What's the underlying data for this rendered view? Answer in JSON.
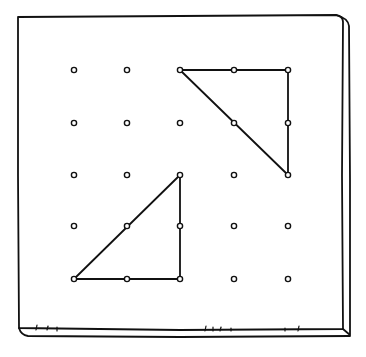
{
  "diagram": {
    "type": "geoboard",
    "grid": {
      "rows": 5,
      "cols": 5
    },
    "colors": {
      "ink": "#111111",
      "background": "#ffffff"
    },
    "board": {
      "face": {
        "x1": 18,
        "y1": 16,
        "x2": 343,
        "y2": 330
      },
      "depth_right": 7,
      "depth_bottom": 7
    },
    "pegs": {
      "xs": [
        74,
        127,
        180,
        234,
        288
      ],
      "ys": [
        70,
        123,
        175,
        226,
        279
      ],
      "radius": 2.6
    },
    "shapes": [
      {
        "name": "upper-right-triangle",
        "kind": "right-triangle",
        "vertices_grid": [
          [
            2,
            0
          ],
          [
            4,
            0
          ],
          [
            4,
            2
          ]
        ],
        "points": "180,70 288,70 288,175"
      },
      {
        "name": "lower-left-triangle",
        "kind": "right-triangle",
        "vertices_grid": [
          [
            2,
            2
          ],
          [
            2,
            4
          ],
          [
            0,
            4
          ]
        ],
        "points": "180,175 180,279 74,279"
      }
    ]
  }
}
